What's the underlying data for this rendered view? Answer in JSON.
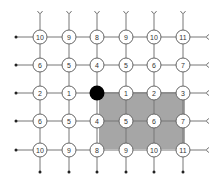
{
  "diagram": {
    "type": "grid-distance-lattice",
    "columns_x": [
      40,
      69,
      97,
      126,
      154,
      183
    ],
    "rows_y": [
      37,
      65,
      93,
      121,
      150
    ],
    "rows": [
      [
        "10",
        "9",
        "8",
        "9",
        "10",
        "11"
      ],
      [
        "6",
        "5",
        "4",
        "5",
        "6",
        "7"
      ],
      [
        "2",
        "1",
        null,
        "1",
        "2",
        "3"
      ],
      [
        "6",
        "5",
        "4",
        "5",
        "6",
        "7"
      ],
      [
        "10",
        "9",
        "8",
        "9",
        "10",
        "11"
      ]
    ],
    "origin": {
      "row": 2,
      "col": 2,
      "color": "#000000"
    },
    "highlight_region": {
      "x": 99,
      "y": 92,
      "width": 86,
      "height": 57,
      "color": "#a6a6a6"
    },
    "colors": {
      "line": "#777777",
      "node_fill": "#ffffff",
      "node_stroke": "#666666",
      "text": "#333333"
    }
  }
}
